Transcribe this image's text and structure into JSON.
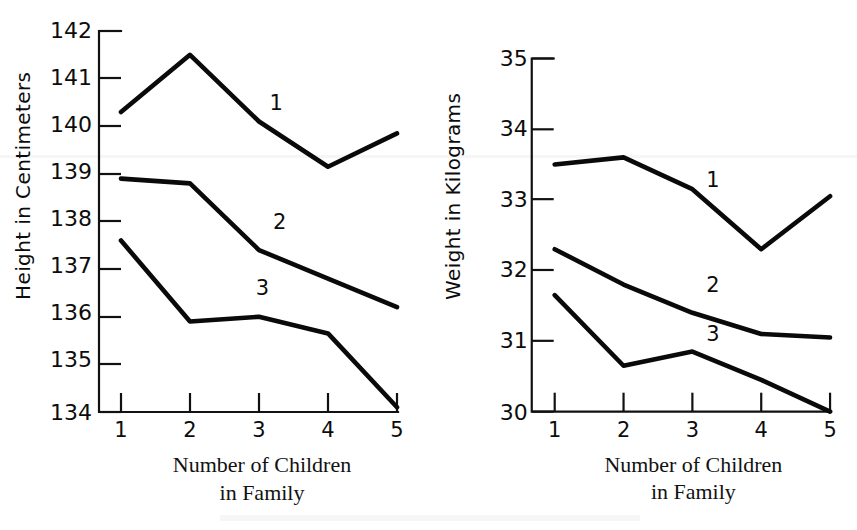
{
  "figure": {
    "caption": "",
    "background_color": "#ffffff",
    "line_color": "#0a0a0a"
  },
  "chart_data": [
    {
      "type": "line",
      "title": "",
      "xlabel": "Number of Children in Family",
      "xlabel_line1": "Number of Children",
      "xlabel_line2": "in Family",
      "ylabel": "Height in Centimeters",
      "x": [
        1,
        2,
        3,
        4,
        5
      ],
      "xticklabels": [
        "1",
        "2",
        "3",
        "4",
        "5"
      ],
      "yticklabels": [
        "142",
        "141",
        "140",
        "139",
        "138",
        "137",
        "136",
        "135",
        "134"
      ],
      "yticks": [
        142,
        141,
        140,
        139,
        138,
        137,
        136,
        135,
        134
      ],
      "xlim": [
        1,
        5
      ],
      "ylim": [
        134,
        142
      ],
      "grid": false,
      "legend_position": "inline-annotations",
      "series": [
        {
          "name": "1",
          "label": "1",
          "label_x": 3.25,
          "label_y": 140.35,
          "values": [
            140.3,
            141.5,
            140.1,
            139.15,
            139.85
          ]
        },
        {
          "name": "2",
          "label": "2",
          "label_x": 3.3,
          "label_y": 137.85,
          "values": [
            138.9,
            138.8,
            137.4,
            136.8,
            136.2
          ]
        },
        {
          "name": "3",
          "label": "3",
          "label_x": 3.05,
          "label_y": 136.45,
          "values": [
            137.6,
            135.9,
            136.0,
            135.65,
            134.1
          ]
        }
      ]
    },
    {
      "type": "line",
      "title": "",
      "xlabel": "Number of Children in Family",
      "xlabel_line1": "Number of Children",
      "xlabel_line2": "in Family",
      "ylabel": "Weight in Kilograms",
      "x": [
        1,
        2,
        3,
        4,
        5
      ],
      "xticklabels": [
        "1",
        "2",
        "3",
        "4",
        "5"
      ],
      "yticklabels": [
        "35",
        "34",
        "33",
        "32",
        "31",
        "30"
      ],
      "yticks": [
        35,
        34,
        33,
        32,
        31,
        30
      ],
      "xlim": [
        1,
        5
      ],
      "ylim": [
        30,
        35
      ],
      "grid": false,
      "legend_position": "inline-annotations",
      "series": [
        {
          "name": "1",
          "label": "1",
          "label_x": 3.3,
          "label_y": 33.18,
          "values": [
            33.5,
            33.6,
            33.15,
            32.3,
            33.05
          ]
        },
        {
          "name": "2",
          "label": "2",
          "label_x": 3.3,
          "label_y": 31.7,
          "values": [
            32.3,
            31.8,
            31.4,
            31.1,
            31.05
          ]
        },
        {
          "name": "3",
          "label": "3",
          "label_x": 3.3,
          "label_y": 31.0,
          "values": [
            31.65,
            30.65,
            30.85,
            30.45,
            30.0
          ]
        }
      ]
    }
  ]
}
